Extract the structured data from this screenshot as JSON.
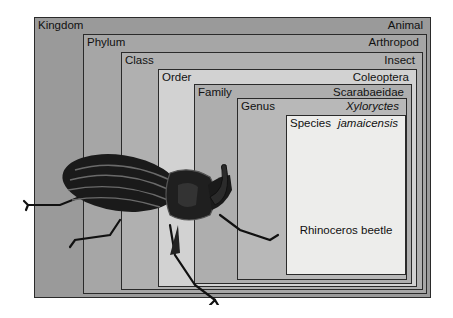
{
  "diagram": {
    "levels": [
      {
        "rank": "Kingdom",
        "taxon": "Animal",
        "italic": false
      },
      {
        "rank": "Phylum",
        "taxon": "Arthropod",
        "italic": false
      },
      {
        "rank": "Class",
        "taxon": "Insect",
        "italic": false
      },
      {
        "rank": "Order",
        "taxon": "Coleoptera",
        "italic": false
      },
      {
        "rank": "Family",
        "taxon": "Scarabaeidae",
        "italic": false
      },
      {
        "rank": "Genus",
        "taxon": "Xyloryctes",
        "italic": true
      },
      {
        "rank": "Species",
        "taxon": "jamaicensis",
        "italic": true
      }
    ],
    "common_name": "Rhinoceros beetle",
    "illustration": "rhinoceros-beetle-drawing",
    "colors": {
      "kingdom": "#9a9a9a",
      "phylum": "#a6a6a6",
      "class": "#b0b0b0",
      "order": "#d2d2d2",
      "family": "#aeaeae",
      "genus": "#b8b8b8",
      "species": "#ededeb",
      "border": "#2a2a2a"
    }
  }
}
